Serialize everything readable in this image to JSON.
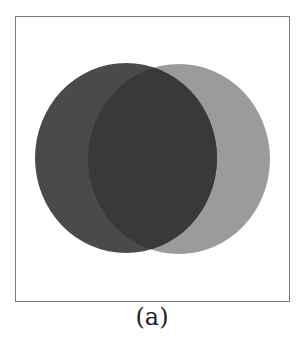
{
  "figure": {
    "caption": "(a)",
    "frame": {
      "stroke": "#7a7a7a",
      "background": "#ffffff"
    },
    "circles": [
      {
        "name": "left-set",
        "cx": 126,
        "cy": 158,
        "rx": 91,
        "ry": 95,
        "fill": "#4a4a4a"
      },
      {
        "name": "right-set",
        "cx": 179,
        "cy": 159,
        "rx": 91,
        "ry": 95,
        "fill": "#9b9b9b"
      }
    ],
    "overlap_fill": "#393939"
  }
}
